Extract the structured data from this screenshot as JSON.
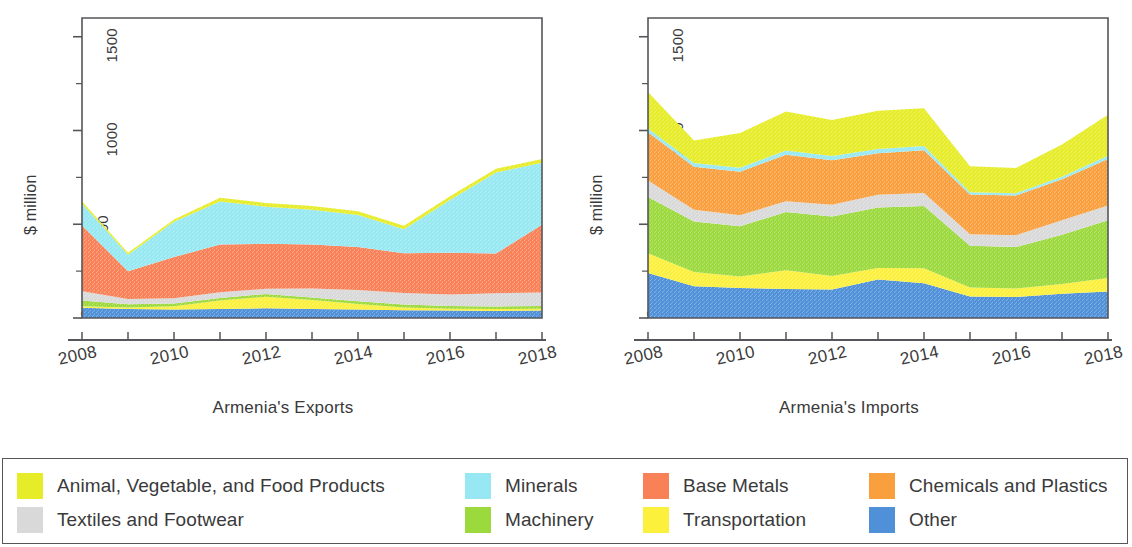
{
  "axis": {
    "ylabel": "$ million",
    "ytick_labels": [
      "0",
      "500",
      "1000",
      "1500"
    ],
    "xtick_labels": [
      "2008",
      "2010",
      "2012",
      "2014",
      "2016",
      "2018"
    ]
  },
  "legend": {
    "items": [
      {
        "label": "Animal, Vegetable, and Food Products",
        "color": "#e6ec28",
        "textured": false
      },
      {
        "label": "Minerals",
        "color": "#97e8f2",
        "textured": false
      },
      {
        "label": "Base Metals",
        "color": "#f98158",
        "textured": true
      },
      {
        "label": "Chemicals and Plastics",
        "color": "#f99f3e",
        "textured": true
      },
      {
        "label": "Textiles and Footwear",
        "color": "#d9d9d9",
        "textured": true
      },
      {
        "label": "Machinery",
        "color": "#9bd93c",
        "textured": false
      },
      {
        "label": "Transportation",
        "color": "#fbf03c",
        "textured": false
      },
      {
        "label": "Other",
        "color": "#4f90d8",
        "textured": true
      }
    ]
  },
  "chart_data": [
    {
      "type": "area",
      "stacked": true,
      "title": "Armenia's Exports",
      "xlabel": "",
      "ylabel": "$ million",
      "ylim": [
        0,
        1600
      ],
      "yticks": [
        0,
        500,
        1000,
        1500
      ],
      "yminor_step": 250,
      "grid": false,
      "legend_position": "bottom-shared",
      "x": [
        2008,
        2009,
        2010,
        2011,
        2012,
        2013,
        2014,
        2015,
        2016,
        2017,
        2018
      ],
      "series": [
        {
          "name": "Other",
          "color": "#4f90d8",
          "values": [
            55,
            48,
            45,
            48,
            52,
            48,
            45,
            42,
            40,
            38,
            40
          ]
        },
        {
          "name": "Transportation",
          "color": "#fbf03c",
          "values": [
            8,
            8,
            18,
            45,
            62,
            48,
            30,
            14,
            10,
            10,
            10
          ]
        },
        {
          "name": "Machinery",
          "color": "#9bd93c",
          "values": [
            30,
            18,
            14,
            14,
            14,
            14,
            14,
            16,
            14,
            14,
            14
          ]
        },
        {
          "name": "Textiles and Footwear",
          "color": "#d9d9d9",
          "values": [
            50,
            28,
            28,
            30,
            28,
            48,
            60,
            62,
            62,
            70,
            72
          ]
        },
        {
          "name": "Base Metals",
          "color": "#f98158",
          "values": [
            350,
            148,
            220,
            255,
            240,
            234,
            230,
            212,
            222,
            212,
            362
          ]
        },
        {
          "name": "Minerals",
          "color": "#97e8f2",
          "values": [
            118,
            88,
            188,
            230,
            198,
            186,
            170,
            128,
            282,
            432,
            330
          ]
        },
        {
          "name": "Animal, Vegetable, and Food Products",
          "color": "#e6ec28",
          "values": [
            12,
            10,
            12,
            20,
            20,
            20,
            20,
            18,
            20,
            20,
            20
          ]
        }
      ]
    },
    {
      "type": "area",
      "stacked": true,
      "title": "Armenia's Imports",
      "xlabel": "",
      "ylabel": "$ million",
      "ylim": [
        0,
        1600
      ],
      "yticks": [
        0,
        500,
        1000,
        1500
      ],
      "yminor_step": 250,
      "grid": false,
      "legend_position": "bottom-shared",
      "x": [
        2008,
        2009,
        2010,
        2011,
        2012,
        2013,
        2014,
        2015,
        2016,
        2017,
        2018
      ],
      "series": [
        {
          "name": "Other",
          "color": "#4f90d8",
          "values": [
            240,
            170,
            160,
            155,
            152,
            205,
            185,
            115,
            112,
            130,
            142
          ]
        },
        {
          "name": "Transportation",
          "color": "#fbf03c",
          "values": [
            105,
            75,
            62,
            100,
            72,
            62,
            80,
            48,
            45,
            52,
            72
          ]
        },
        {
          "name": "Machinery",
          "color": "#9bd93c",
          "values": [
            300,
            270,
            268,
            310,
            318,
            322,
            332,
            222,
            222,
            262,
            308
          ]
        },
        {
          "name": "Textiles and Footwear",
          "color": "#d9d9d9",
          "values": [
            88,
            62,
            58,
            58,
            62,
            68,
            70,
            62,
            62,
            78,
            78
          ]
        },
        {
          "name": "Base Metals",
          "color": "#f98158",
          "values": [
            0,
            0,
            0,
            0,
            0,
            0,
            0,
            0,
            0,
            0,
            0
          ]
        },
        {
          "name": "Chemicals and Plastics",
          "color": "#f99f3e",
          "values": [
            258,
            230,
            232,
            248,
            238,
            222,
            228,
            212,
            212,
            218,
            248
          ]
        },
        {
          "name": "Minerals",
          "color": "#97e8f2",
          "values": [
            20,
            20,
            22,
            22,
            22,
            22,
            22,
            12,
            12,
            14,
            18
          ]
        },
        {
          "name": "Animal, Vegetable, and Food Products",
          "color": "#e6ec28",
          "values": [
            195,
            120,
            185,
            208,
            192,
            205,
            202,
            138,
            135,
            172,
            218
          ]
        }
      ]
    }
  ]
}
